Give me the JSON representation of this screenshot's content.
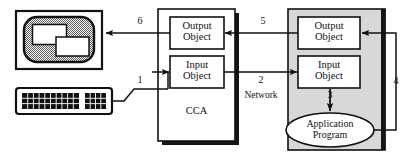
{
  "diagram": {
    "colors": {
      "line": "#111111",
      "shadow": "#161616",
      "gray_fill": "#d8d8d8",
      "screen_fill": "#b5b5b5",
      "white": "#ffffff"
    },
    "client_device": {
      "monitor_name": "monitor",
      "keyboard_name": "keyboard",
      "window_count": 2
    },
    "cca_panel": {
      "title": "CCA",
      "boxes": [
        {
          "line1": "Output",
          "line2": "Object"
        },
        {
          "line1": "Input",
          "line2": "Object"
        }
      ]
    },
    "server_panel": {
      "boxes": [
        {
          "line1": "Output",
          "line2": "Object"
        },
        {
          "line1": "Input",
          "line2": "Object"
        }
      ],
      "ellipse": {
        "line1": "Application",
        "line2": "Program"
      }
    },
    "network_label": "Network",
    "flow_labels": {
      "one": "1",
      "two": "2",
      "three": "3",
      "four": "4",
      "five": "5",
      "six": "6"
    }
  }
}
